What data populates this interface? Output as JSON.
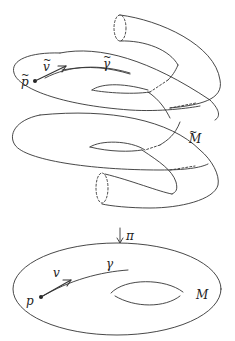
{
  "figure": {
    "kind": "covering-space-diagram",
    "colors": {
      "stroke": "#333333",
      "background": "#ffffff"
    }
  },
  "upper": {
    "point_label": "p",
    "vector_label": "v",
    "curve_label": "γ",
    "space_label": "M",
    "tilde": "~"
  },
  "projection": {
    "arrow": "↓",
    "label": "π"
  },
  "lower": {
    "point_label": "p",
    "vector_label": "v",
    "curve_label": "γ",
    "space_label": "M"
  }
}
